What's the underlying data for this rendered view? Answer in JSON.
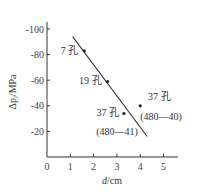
{
  "chart_data": {
    "type": "scatter",
    "title": "",
    "xlabel": "d/cm",
    "ylabel": "Δp_i/MPa",
    "xlim": [
      0,
      5.5
    ],
    "ylim": [
      0,
      110
    ],
    "x_ticks": [
      "0",
      "1",
      "2",
      "3",
      "4",
      "5"
    ],
    "y_ticks": [
      "-20",
      "-40",
      "-60",
      "-80",
      "-100"
    ],
    "grid": false,
    "points": [
      {
        "label": "7 孔",
        "x": 1.6,
        "y": 83
      },
      {
        "label": "19 孔",
        "x": 2.6,
        "y": 59
      },
      {
        "label": "37 孔",
        "sublabel": "(480—41)",
        "x": 3.3,
        "y": 34
      },
      {
        "label": "37 孔",
        "sublabel": "(480—40)",
        "x": 4.0,
        "y": 40
      }
    ],
    "fit_line": {
      "x": [
        1.1,
        4.3
      ],
      "y": [
        94,
        16
      ]
    }
  },
  "axes": {
    "x_title": "d/cm",
    "y_title": "Δp",
    "y_title_sub": "i",
    "y_title_unit": "/MPa"
  }
}
